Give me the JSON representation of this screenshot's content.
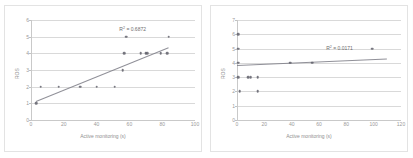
{
  "figure": {
    "panel_count": 2,
    "background_color": "#ffffff",
    "point_color": "#5b5b66",
    "trendline_color": "#7d7d86",
    "gridline_color": "#d9d9d9"
  },
  "chart_data": [
    {
      "type": "scatter",
      "title": "",
      "xlabel": "Active monitoring (s)",
      "ylabel": "ROS",
      "xlim": [
        0,
        100
      ],
      "ylim": [
        0,
        6
      ],
      "xticks": [
        0,
        20,
        40,
        60,
        80,
        100
      ],
      "yticks": [
        0,
        1,
        2,
        3,
        4,
        5,
        6
      ],
      "grid": "horizontal",
      "legend": "none",
      "annotation": "R² = 0.6872",
      "annotation_label": "R",
      "annotation_sup": "2",
      "annotation_value": "= 0.6872",
      "r_squared": 0.6872,
      "annotation_x": 62,
      "annotation_y": 5.45,
      "trendline": {
        "type": "linear",
        "x_start": 3,
        "y_start": 1.12,
        "x_end": 84,
        "y_end": 4.35
      },
      "points": [
        {
          "x": 3,
          "y": 1
        },
        {
          "x": 6,
          "y": 2
        },
        {
          "x": 17,
          "y": 2
        },
        {
          "x": 30,
          "y": 2
        },
        {
          "x": 40,
          "y": 2
        },
        {
          "x": 51,
          "y": 2
        },
        {
          "x": 56,
          "y": 3
        },
        {
          "x": 57,
          "y": 4
        },
        {
          "x": 58,
          "y": 5
        },
        {
          "x": 67,
          "y": 4
        },
        {
          "x": 70,
          "y": 4
        },
        {
          "x": 71,
          "y": 4
        },
        {
          "x": 79,
          "y": 4
        },
        {
          "x": 83,
          "y": 4
        },
        {
          "x": 84,
          "y": 5
        }
      ]
    },
    {
      "type": "scatter",
      "title": "",
      "xlabel": "Active monitoring (s)",
      "ylabel": "ROS",
      "xlim": [
        0,
        120
      ],
      "ylim": [
        0,
        7
      ],
      "xticks": [
        0,
        20,
        40,
        60,
        80,
        100,
        120
      ],
      "yticks": [
        0,
        1,
        2,
        3,
        4,
        5,
        6,
        7
      ],
      "grid": "horizontal",
      "legend": "none",
      "annotation": "R² = 0.0171",
      "annotation_label": "R",
      "annotation_sup": "2",
      "annotation_value": "= 0.0171",
      "r_squared": 0.0171,
      "annotation_x": 75,
      "annotation_y": 5.05,
      "trendline": {
        "type": "linear",
        "x_start": 0,
        "y_start": 3.82,
        "x_end": 110,
        "y_end": 4.28
      },
      "points": [
        {
          "x": 1,
          "y": 6
        },
        {
          "x": 1,
          "y": 5
        },
        {
          "x": 1,
          "y": 4
        },
        {
          "x": 1,
          "y": 3
        },
        {
          "x": 2,
          "y": 2
        },
        {
          "x": 8,
          "y": 3
        },
        {
          "x": 10,
          "y": 3
        },
        {
          "x": 15,
          "y": 3
        },
        {
          "x": 15,
          "y": 2
        },
        {
          "x": 39,
          "y": 4
        },
        {
          "x": 55,
          "y": 4
        },
        {
          "x": 99,
          "y": 5
        }
      ]
    }
  ]
}
